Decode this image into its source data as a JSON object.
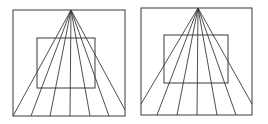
{
  "figure": {
    "background_color": "#ffffff",
    "line_color": "#3a3a3a",
    "canvas": {
      "width": 268,
      "height": 124
    },
    "panel_count": 2
  },
  "panels": [
    {
      "id": "left-panel",
      "name": "left-illusion-panel",
      "outer_square": {
        "x": 13,
        "y": 10,
        "width": 112,
        "height": 106
      },
      "inner_square": {
        "x": 37,
        "y": 38,
        "width": 58,
        "height": 50
      },
      "apex": {
        "x": 71,
        "y": 10
      },
      "ray_count": 7,
      "ray_endpoints": [
        {
          "x": 13,
          "y": 116
        },
        {
          "x": 31,
          "y": 116
        },
        {
          "x": 50,
          "y": 116
        },
        {
          "x": 70,
          "y": 116
        },
        {
          "x": 90,
          "y": 116
        },
        {
          "x": 109,
          "y": 116
        },
        {
          "x": 125,
          "y": 110
        }
      ]
    },
    {
      "id": "right-panel",
      "name": "right-illusion-panel",
      "outer_square": {
        "x": 141,
        "y": 8,
        "width": 111,
        "height": 107
      },
      "inner_square": {
        "x": 164,
        "y": 35,
        "width": 64,
        "height": 48
      },
      "apex": {
        "x": 198,
        "y": 8
      },
      "ray_count": 7,
      "ray_endpoints": [
        {
          "x": 141,
          "y": 104
        },
        {
          "x": 157,
          "y": 115
        },
        {
          "x": 177,
          "y": 115
        },
        {
          "x": 197,
          "y": 115
        },
        {
          "x": 217,
          "y": 115
        },
        {
          "x": 236,
          "y": 115
        },
        {
          "x": 252,
          "y": 104
        }
      ]
    }
  ]
}
